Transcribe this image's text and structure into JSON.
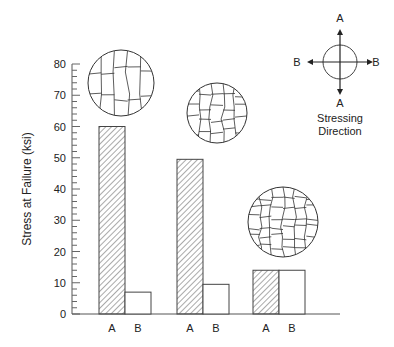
{
  "chart_data": {
    "type": "bar",
    "title": "",
    "xlabel": "",
    "ylabel": "Stress at Failure (ksi)",
    "ylim": [
      0,
      80
    ],
    "yticks": [
      0,
      10,
      20,
      30,
      40,
      50,
      60,
      70,
      80
    ],
    "grid": false,
    "groups": [
      {
        "name": "Group 1",
        "bars": [
          {
            "label": "A",
            "value": 60,
            "hatched": true
          },
          {
            "label": "B",
            "value": 7,
            "hatched": false
          }
        ],
        "micrograph": "elongated cells aligned with A direction"
      },
      {
        "name": "Group 2",
        "bars": [
          {
            "label": "A",
            "value": 49.5,
            "hatched": true
          },
          {
            "label": "B",
            "value": 9.5,
            "hatched": false
          }
        ],
        "micrograph": "moderately elongated cells"
      },
      {
        "name": "Group 3",
        "bars": [
          {
            "label": "A",
            "value": 14,
            "hatched": true
          },
          {
            "label": "B",
            "value": 14,
            "hatched": false
          }
        ],
        "micrograph": "equiaxed cells"
      }
    ],
    "categories": [
      "A",
      "B",
      "A",
      "B",
      "A",
      "B"
    ],
    "values": [
      60,
      7,
      49.5,
      9.5,
      14,
      14
    ],
    "legend": {
      "position": "top-right",
      "type": "stressing-direction-diagram",
      "labels": {
        "top": "A",
        "bottom": "A",
        "left": "B",
        "right": "B"
      },
      "caption_line1": "Stressing",
      "caption_line2": "Direction"
    }
  }
}
